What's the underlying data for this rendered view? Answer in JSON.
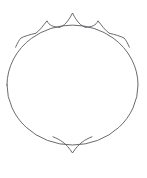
{
  "document": {
    "title": "Crowned Oval Line Drawing",
    "background_color": "#ffffff",
    "width": 147,
    "height": 178,
    "description": "Thin line drawing of an oval with five outward cusps along the upper arc and one inward cusp at the bottom"
  },
  "figure": {
    "name": "crowned-oval",
    "stroke_color": "#5a5a5f",
    "stroke_width": 0.9,
    "fill": "none",
    "ellipse": {
      "center_x": 72.5,
      "center_y": 85,
      "radius_x": 65.5,
      "radius_y": 60,
      "left": 7,
      "right": 138,
      "top": 25,
      "bottom": 145
    },
    "cusps": [
      {
        "id": "cusp-top-center",
        "base_left_x": 60,
        "base_left_y": 27,
        "apex_x": 72.5,
        "apex_y": 13,
        "base_right_x": 85,
        "base_right_y": 27,
        "direction": "outward"
      },
      {
        "id": "cusp-top-left",
        "base_left_x": 36,
        "base_left_y": 33,
        "apex_x": 47,
        "apex_y": 21,
        "base_right_x": 59,
        "base_right_y": 27,
        "direction": "outward"
      },
      {
        "id": "cusp-top-right",
        "base_left_x": 86,
        "base_left_y": 27,
        "apex_x": 98,
        "apex_y": 21,
        "base_right_x": 109,
        "base_right_y": 33,
        "direction": "outward"
      },
      {
        "id": "cusp-side-left",
        "base_left_x": 16,
        "base_left_y": 47,
        "apex_x": 21,
        "apex_y": 38,
        "base_right_x": 35,
        "base_right_y": 33,
        "direction": "outward"
      },
      {
        "id": "cusp-side-right",
        "base_left_x": 110,
        "base_left_y": 33,
        "apex_x": 124,
        "apex_y": 38,
        "base_right_x": 129,
        "base_right_y": 47,
        "direction": "outward"
      },
      {
        "id": "cusp-bottom-center",
        "base_left_x": 53,
        "base_left_y": 137,
        "apex_x": 72.5,
        "apex_y": 153,
        "base_right_x": 92,
        "base_right_y": 137,
        "direction": "inward"
      }
    ],
    "paths": {
      "oval_outline": "M 7,85 A 65.5,60 0 0 1 31.8,38.1 A 65.5,60 0 0 1 113.2,38.1 A 65.5,60 0 0 1 138,85 A 65.5,60 0 0 1 72.5,145 A 65.5,60 0 0 1 7,85 Z",
      "crown_top_center": "M 59.5,27.4 C 64,26 68,22 72.5,13 C 77,22 81,26 85.5,27.4",
      "crown_top_left": "M 35.6,33.4 C 40,30.5 43.5,25 47,20.8 C 49,25.5 53,26.8 59.2,27.3",
      "crown_top_right": "M 85.8,27.3 C 92,26.8 96,25.5 98,20.8 C 101.5,25 105,30.5 109.4,33.4",
      "crown_side_left": "M 15.6,47.2 C 17.5,43 19,40 21,38 C 24,36.4 30,34.5 35.3,33.4",
      "crown_side_right": "M 109.7,33.4 C 115,34.5 121,36.4 124,38 C 126,40 127.5,43 129.4,47.2",
      "bottom_cusp": "M 53,136.8 C 60,139.5 66,143 72.5,153 C 79,143 85,139.5 92,136.8"
    }
  }
}
